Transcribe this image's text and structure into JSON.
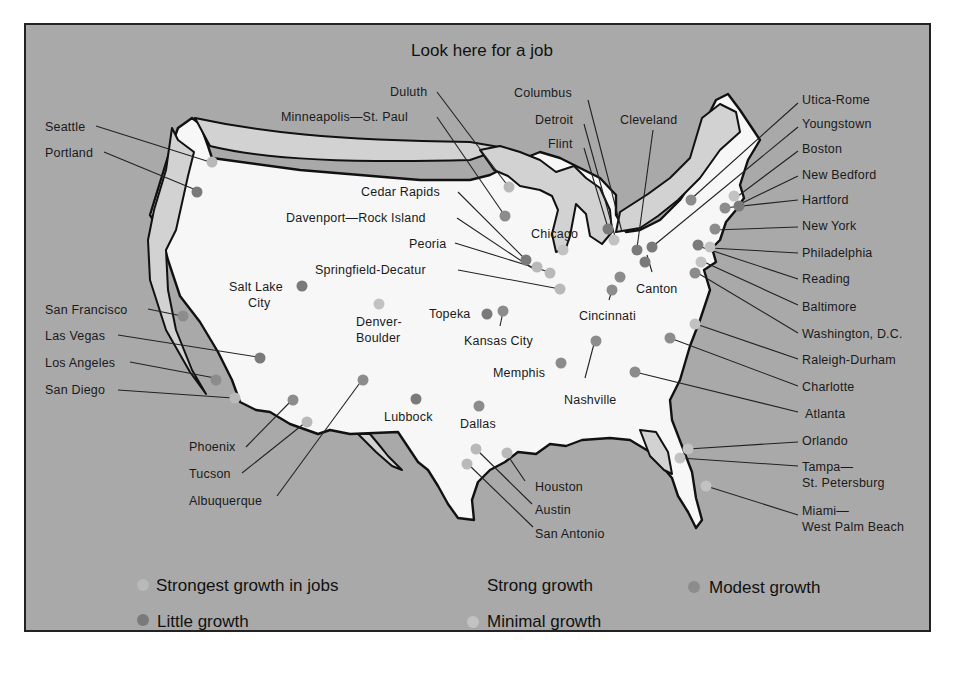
{
  "title": "Look here for a job",
  "colors": {
    "background": "#a9a9a9",
    "land": "#f7f7f7",
    "border": "#111111",
    "water_shading": "#d2d2d2",
    "strongest": "#b9b9b9",
    "strong": "#a9a9a9",
    "modest": "#8c8c8c",
    "little": "#7a7a7a",
    "minimal": "#c2c2c2"
  },
  "legend": [
    {
      "key": "strongest",
      "label": "Strongest growth in jobs"
    },
    {
      "key": "strong",
      "label": "Strong growth"
    },
    {
      "key": "modest",
      "label": "Modest growth"
    },
    {
      "key": "little",
      "label": "Little growth"
    },
    {
      "key": "minimal",
      "label": "Minimal growth"
    }
  ],
  "cities": [
    {
      "name": "Seattle",
      "category": "strongest"
    },
    {
      "name": "Portland",
      "category": "little"
    },
    {
      "name": "San Francisco",
      "category": "modest"
    },
    {
      "name": "Las Vegas",
      "category": "little"
    },
    {
      "name": "Los Angeles",
      "category": "modest"
    },
    {
      "name": "San Diego",
      "category": "strongest"
    },
    {
      "name": "Phoenix",
      "category": "modest"
    },
    {
      "name": "Tucson",
      "category": "strongest"
    },
    {
      "name": "Albuquerque",
      "category": "modest"
    },
    {
      "name": "Salt Lake City",
      "category": "little"
    },
    {
      "name": "Denver-Boulder",
      "category": "minimal"
    },
    {
      "name": "Lubbock",
      "category": "little"
    },
    {
      "name": "Dallas",
      "category": "modest"
    },
    {
      "name": "Topeka",
      "category": "little"
    },
    {
      "name": "Kansas City",
      "category": "modest"
    },
    {
      "name": "Memphis",
      "category": "modest"
    },
    {
      "name": "Nashville",
      "category": "modest"
    },
    {
      "name": "Houston",
      "category": "strongest"
    },
    {
      "name": "Austin",
      "category": "strongest"
    },
    {
      "name": "San Antonio",
      "category": "strongest"
    },
    {
      "name": "Duluth",
      "category": "strongest"
    },
    {
      "name": "Minneapolis—St. Paul",
      "category": "modest"
    },
    {
      "name": "Cedar Rapids",
      "category": "little"
    },
    {
      "name": "Davenport—Rock Island",
      "category": "strongest"
    },
    {
      "name": "Peoria",
      "category": "strongest"
    },
    {
      "name": "Springfield-Decatur",
      "category": "strongest"
    },
    {
      "name": "Chicago",
      "category": "minimal"
    },
    {
      "name": "Columbus",
      "category": "minimal"
    },
    {
      "name": "Detroit",
      "category": "little"
    },
    {
      "name": "Flint",
      "category": "little"
    },
    {
      "name": "Cleveland",
      "category": "modest"
    },
    {
      "name": "Cincinnati",
      "category": "modest"
    },
    {
      "name": "Canton",
      "category": "little"
    },
    {
      "name": "Utica-Rome",
      "category": "modest"
    },
    {
      "name": "Youngstown",
      "category": "little"
    },
    {
      "name": "Boston",
      "category": "minimal"
    },
    {
      "name": "New Bedford",
      "category": "little"
    },
    {
      "name": "Hartford",
      "category": "modest"
    },
    {
      "name": "New York",
      "category": "modest"
    },
    {
      "name": "Philadelphia",
      "category": "minimal"
    },
    {
      "name": "Reading",
      "category": "little"
    },
    {
      "name": "Baltimore",
      "category": "minimal"
    },
    {
      "name": "Washington, D.C.",
      "category": "modest"
    },
    {
      "name": "Raleigh-Durham",
      "category": "minimal"
    },
    {
      "name": "Charlotte",
      "category": "modest"
    },
    {
      "name": "Atlanta",
      "category": "modest"
    },
    {
      "name": "Orlando",
      "category": "minimal"
    },
    {
      "name": "Tampa—St. Petersburg",
      "category": "minimal"
    },
    {
      "name": "Miami—West Palm Beach",
      "category": "minimal"
    }
  ],
  "labels": {
    "seattle": "Seattle",
    "portland": "Portland",
    "sanfrancisco": "San Francisco",
    "lasvegas": "Las Vegas",
    "losangeles": "Los Angeles",
    "sandiego": "San Diego",
    "phoenix": "Phoenix",
    "tucson": "Tucson",
    "albuquerque": "Albuquerque",
    "saltlake1": "Salt Lake",
    "saltlake2": "City",
    "denver1": "Denver-",
    "denver2": "Boulder",
    "lubbock": "Lubbock",
    "dallas": "Dallas",
    "topeka": "Topeka",
    "kansascity": "Kansas City",
    "memphis": "Memphis",
    "nashville": "Nashville",
    "houston": "Houston",
    "austin": "Austin",
    "sanantonio": "San Antonio",
    "duluth": "Duluth",
    "minneapolis": "Minneapolis—St. Paul",
    "cedarrapids": "Cedar Rapids",
    "davenport": "Davenport—Rock Island",
    "peoria": "Peoria",
    "springfield": "Springfield-Decatur",
    "chicago": "Chicago",
    "columbus": "Columbus",
    "detroit": "Detroit",
    "flint": "Flint",
    "cleveland": "Cleveland",
    "cincinnati": "Cincinnati",
    "canton": "Canton",
    "utica": "Utica-Rome",
    "youngstown": "Youngstown",
    "boston": "Boston",
    "newbedford": "New Bedford",
    "hartford": "Hartford",
    "newyork": "New York",
    "philadelphia": "Philadelphia",
    "reading": "Reading",
    "baltimore": "Baltimore",
    "washington": "Washington, D.C.",
    "raleigh": "Raleigh-Durham",
    "charlotte": "Charlotte",
    "atlanta": "Atlanta",
    "orlando": "Orlando",
    "tampa1": "Tampa—",
    "tampa2": "St. Petersburg",
    "miami1": "Miami—",
    "miami2": "West Palm Beach"
  }
}
